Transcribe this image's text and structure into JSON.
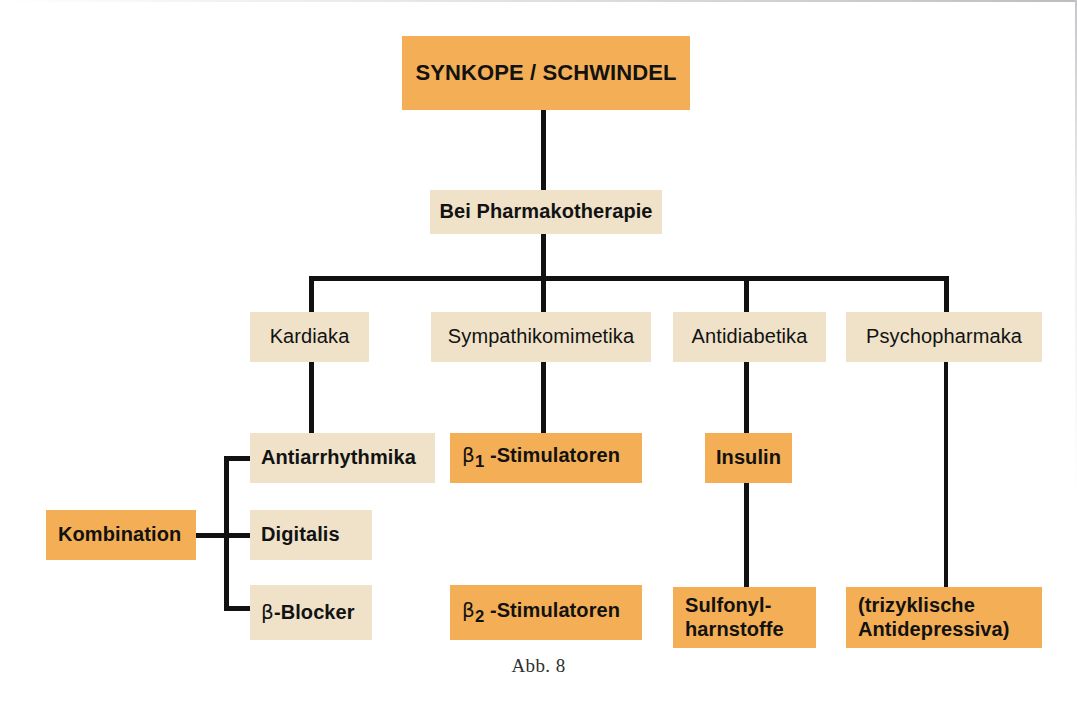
{
  "figure": {
    "caption": "Abb. 8",
    "colors": {
      "orange": "#f4ae55",
      "cream": "#efe2c9",
      "line": "#111111",
      "text": "#121212",
      "background": "#ffffff"
    }
  },
  "nodes": {
    "root": {
      "label": "SYNKOPE  /  SCHWINDEL",
      "fill": "orange",
      "weight": "bold"
    },
    "therapy": {
      "label": "Bei Pharmakotherapie",
      "fill": "cream",
      "weight": "bold"
    },
    "class_cardiaca": {
      "label": "Kardiaka",
      "fill": "cream",
      "weight": "normal"
    },
    "class_sympathomimetics": {
      "label": "Sympathikomimetika",
      "fill": "cream",
      "weight": "normal"
    },
    "class_antidiabetics": {
      "label": "Antidiabetika",
      "fill": "cream",
      "weight": "normal"
    },
    "class_psychopharmaka": {
      "label": "Psychopharmaka",
      "fill": "cream",
      "weight": "normal"
    },
    "antiarrhythmika": {
      "label": "Antiarrhythmika",
      "fill": "cream",
      "weight": "bold"
    },
    "digitalis": {
      "label": "Digitalis",
      "fill": "cream",
      "weight": "bold"
    },
    "betablocker": {
      "label_beta": "β",
      "label_rest": "-Blocker",
      "fill": "cream",
      "weight": "bold"
    },
    "kombination": {
      "label": "Kombination",
      "fill": "orange",
      "weight": "bold"
    },
    "beta1_stimulators": {
      "label_beta": "β",
      "label_sub": "1",
      "label_rest": " -Stimulatoren",
      "fill": "orange",
      "weight": "bold"
    },
    "beta2_stimulators": {
      "label_beta": "β",
      "label_sub": "2",
      "label_rest": " -Stimulatoren",
      "fill": "orange",
      "weight": "bold"
    },
    "insulin": {
      "label": "Insulin",
      "fill": "orange",
      "weight": "bold"
    },
    "sulfonylharnstoffe": {
      "label_line1": "Sulfonyl-",
      "label_line2": "harnstoffe",
      "fill": "orange",
      "weight": "bold"
    },
    "trizyklische": {
      "label_line1": "(trizyklische",
      "label_line2": "Antidepressiva)",
      "fill": "orange",
      "weight": "bold"
    }
  }
}
